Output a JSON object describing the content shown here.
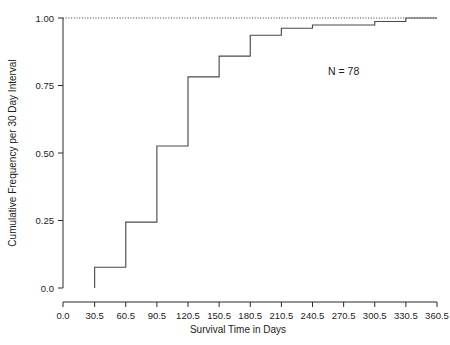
{
  "chart_data": {
    "type": "line",
    "subtype": "step-cumulative-frequency",
    "title": "",
    "xlabel": "Survival Time in Days",
    "ylabel": "Cumulative Frequency per 30 Day Interval",
    "xlim": [
      0.0,
      360.5
    ],
    "ylim": [
      0.0,
      1.0
    ],
    "grid": false,
    "legend": null,
    "xticks": [
      "0.0",
      "30.5",
      "60.5",
      "90.5",
      "120.5",
      "150.5",
      "180.5",
      "210.5",
      "240.5",
      "270.5",
      "300.5",
      "330.5",
      "360.5"
    ],
    "xtick_values": [
      0.0,
      30.5,
      60.5,
      90.5,
      120.5,
      150.5,
      180.5,
      210.5,
      240.5,
      270.5,
      300.5,
      330.5,
      360.5
    ],
    "yticks": [
      "0.0",
      "0.25",
      "0.50",
      "0.75",
      "1.00"
    ],
    "ytick_values": [
      0.0,
      0.25,
      0.5,
      0.75,
      1.0
    ],
    "x": [
      30.5,
      60.5,
      90.5,
      120.5,
      150.5,
      180.5,
      210.5,
      240.5,
      270.5,
      300.5,
      330.5,
      360.5
    ],
    "values": [
      0.077,
      0.244,
      0.526,
      0.782,
      0.859,
      0.936,
      0.962,
      0.974,
      0.974,
      0.987,
      1.0,
      1.0
    ],
    "reference_line": {
      "y": 1.0,
      "style": "dotted",
      "from_x": 0.0,
      "to_x": 360.5
    },
    "annotations": [
      {
        "text": "N = 78",
        "x": 270.5,
        "y": 0.79
      }
    ],
    "line_color": "#4a4a4a",
    "axis_color": "#2b2b2b",
    "background_color": "#ffffff"
  },
  "annotation": {
    "n_label": "N = 78"
  },
  "axes": {
    "x_title": "Survival Time in Days",
    "y_title": "Cumulative Frequency per 30 Day Interval"
  }
}
